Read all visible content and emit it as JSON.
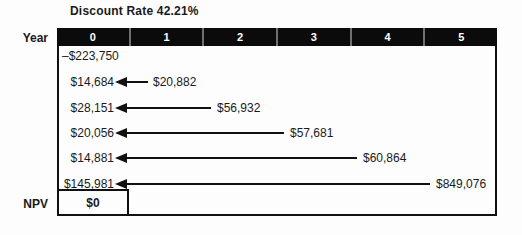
{
  "title": "Discount Rate 42.21%",
  "timeline": {
    "label": "Year",
    "years": [
      "0",
      "1",
      "2",
      "3",
      "4",
      "5"
    ]
  },
  "cashflows": {
    "initial": "–$223,750",
    "rows": [
      {
        "pv": "$14,684",
        "fv": "$20,882",
        "year": "1"
      },
      {
        "pv": "$28,151",
        "fv": "$56,932",
        "year": "2"
      },
      {
        "pv": "$20,056",
        "fv": "$57,681",
        "year": "3"
      },
      {
        "pv": "$14,881",
        "fv": "$60,864",
        "year": "4"
      },
      {
        "pv": "$145,981",
        "fv": "$849,076",
        "year": "5"
      }
    ]
  },
  "npv": {
    "label": "NPV",
    "value": "$0"
  },
  "colors": {
    "bar": "#0b0b0b",
    "line": "#111111",
    "background": "#fdfdfd",
    "bar_text": "#ffffff"
  }
}
